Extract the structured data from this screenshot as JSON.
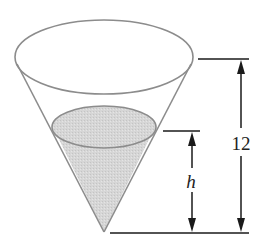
{
  "diagram": {
    "type": "conical-tank",
    "labels": {
      "total_height": "12",
      "water_height": "h"
    },
    "colors": {
      "outline": "#8c8c8c",
      "water_fill": "#d9d9d9",
      "dimension_lines": "#1a1a1a",
      "background": "#ffffff"
    },
    "geometry": {
      "top_ellipse": {
        "cx": 104,
        "cy": 57,
        "rx": 89,
        "ry": 37
      },
      "water_ellipse": {
        "cx": 104,
        "cy": 127,
        "rx": 52,
        "ry": 21
      },
      "apex": {
        "x": 104,
        "y": 232
      },
      "dim_top_y": 59,
      "dim_water_y": 131,
      "dim_bottom_y": 233
    }
  }
}
